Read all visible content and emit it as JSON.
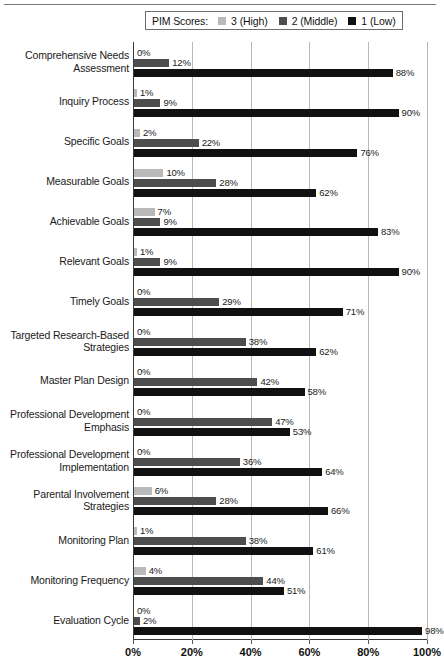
{
  "legend": {
    "title": "PIM Scores:",
    "entries": [
      {
        "label": "3 (High)",
        "color": "#b9b9b9",
        "key": "high"
      },
      {
        "label": "2 (Middle)",
        "color": "#4d4d4d",
        "key": "middle"
      },
      {
        "label": "1 (Low)",
        "color": "#111111",
        "key": "low"
      }
    ]
  },
  "axis": {
    "ticks": [
      "0%",
      "20%",
      "40%",
      "60%",
      "80%",
      "100%"
    ],
    "tick_values": [
      0,
      20,
      40,
      60,
      80,
      100
    ]
  },
  "chart_data": {
    "type": "bar",
    "title": "",
    "xlabel": "",
    "ylabel": "",
    "xlim": [
      0,
      100
    ],
    "grid": true,
    "orientation": "horizontal",
    "legend_position": "top",
    "legend_title": "PIM Scores:",
    "categories": [
      "Comprehensive Needs Assessment",
      "Inquiry Process",
      "Specific Goals",
      "Measurable Goals",
      "Achievable Goals",
      "Relevant Goals",
      "Timely Goals",
      "Targeted Research-Based Strategies",
      "Master Plan Design",
      "Professional Development Emphasis",
      "Professional Development Implementation",
      "Parental Involvement Strategies",
      "Monitoring Plan",
      "Monitoring Frequency",
      "Evaluation Cycle"
    ],
    "series": [
      {
        "name": "3 (High)",
        "color": "#b9b9b9",
        "values": [
          0,
          1,
          2,
          10,
          7,
          1,
          0,
          0,
          0,
          0,
          0,
          6,
          1,
          4,
          0
        ],
        "labels": [
          "0%",
          "1%",
          "2%",
          "10%",
          "7%",
          "1%",
          "0%",
          "0%",
          "0%",
          "0%",
          "0%",
          "6%",
          "1%",
          "4%",
          "0%"
        ]
      },
      {
        "name": "2 (Middle)",
        "color": "#4d4d4d",
        "values": [
          12,
          9,
          22,
          28,
          9,
          9,
          29,
          38,
          42,
          47,
          36,
          28,
          38,
          44,
          2
        ],
        "labels": [
          "12%",
          "9%",
          "22%",
          "28%",
          "9%",
          "9%",
          "29%",
          "38%",
          "42%",
          "47%",
          "36%",
          "28%",
          "38%",
          "44%",
          "2%"
        ]
      },
      {
        "name": "1 (Low)",
        "color": "#111111",
        "values": [
          88,
          90,
          76,
          62,
          83,
          90,
          71,
          62,
          58,
          53,
          64,
          66,
          61,
          51,
          98
        ],
        "labels": [
          "88%",
          "90%",
          "76%",
          "62%",
          "83%",
          "90%",
          "71%",
          "62%",
          "58%",
          "53%",
          "64%",
          "66%",
          "61%",
          "51%",
          "98%"
        ]
      }
    ]
  }
}
